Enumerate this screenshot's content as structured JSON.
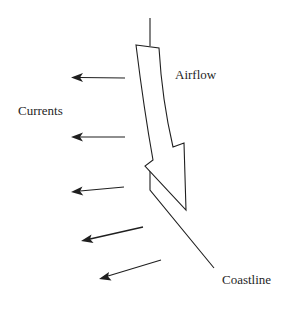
{
  "diagram": {
    "labels": {
      "airflow": "Airflow",
      "currents": "Currents",
      "coastline": "Coastline"
    },
    "colors": {
      "stroke": "#1f1f1f",
      "background": "#ffffff"
    },
    "elements": {
      "airflow_arrow": "large hollow curved arrow pointing down along the coast",
      "coastline": "line running from top down then diagonally to lower right",
      "current_arrows": [
        {
          "from": [
            125,
            78
          ],
          "to": [
            70,
            77
          ]
        },
        {
          "from": [
            125,
            137
          ],
          "to": [
            70,
            137
          ]
        },
        {
          "from": [
            124,
            187
          ],
          "to": [
            71,
            192
          ]
        },
        {
          "from": [
            143,
            227
          ],
          "to": [
            81,
            241
          ]
        },
        {
          "from": [
            161,
            260
          ],
          "to": [
            99,
            279
          ]
        }
      ]
    }
  }
}
